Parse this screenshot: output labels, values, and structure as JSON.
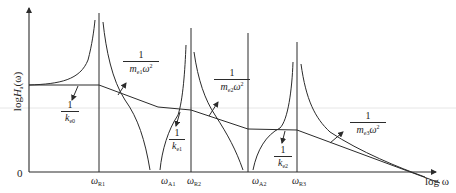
{
  "diagram": {
    "y_axis_label": {
      "prefix": "log",
      "symbol": "H",
      "sub": "a",
      "suffix": "(ω)"
    },
    "x_axis_label": "log ω",
    "origin_label": "0",
    "x_ticks": [
      {
        "symbol": "ω",
        "sub": "R1"
      },
      {
        "symbol": "ω",
        "sub": "A1"
      },
      {
        "symbol": "ω",
        "sub": "R2"
      },
      {
        "symbol": "ω",
        "sub": "A2"
      },
      {
        "symbol": "ω",
        "sub": "R3"
      }
    ],
    "annotations": {
      "k_e0": {
        "num": "1",
        "den_symbol": "k",
        "den_sub": "e0"
      },
      "k_e1": {
        "num": "1",
        "den_symbol": "k",
        "den_sub": "e1"
      },
      "k_e2": {
        "num": "1",
        "den_symbol": "k",
        "den_sub": "e2"
      },
      "m_e1": {
        "num": "1",
        "den_symbol": "m",
        "den_sub": "e1",
        "den_tail": "ω",
        "den_sup": "2"
      },
      "m_e2": {
        "num": "1",
        "den_symbol": "m",
        "den_sub": "e2",
        "den_tail": "ω",
        "den_sup": "2"
      },
      "m_e3": {
        "num": "1",
        "den_symbol": "m",
        "den_sub": "e3",
        "den_tail": "ω",
        "den_sup": "2"
      }
    },
    "colors": {
      "line": "#2b2b2b",
      "background": "#ffffff"
    }
  }
}
